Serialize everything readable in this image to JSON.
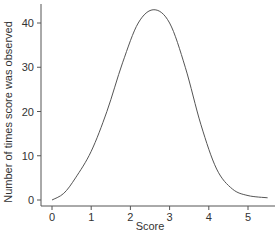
{
  "chart_data": {
    "type": "line",
    "title": "",
    "xlabel": "Score",
    "ylabel": "Number of times score was observed",
    "xlim": [
      -0.25,
      5.6
    ],
    "ylim": [
      -1,
      45
    ],
    "grid": false,
    "legend": null,
    "x_ticks": [
      0,
      1,
      2,
      3,
      4,
      5
    ],
    "y_ticks": [
      0,
      10,
      20,
      30,
      40
    ],
    "series": [
      {
        "name": "Observed frequency",
        "color": "#555555",
        "x": [
          0,
          0.3,
          0.6,
          1.0,
          1.4,
          1.8,
          2.2,
          2.6,
          3.0,
          3.4,
          3.8,
          4.2,
          4.6,
          5.0,
          5.5
        ],
        "values": [
          0,
          1.5,
          5,
          11,
          20,
          31,
          40,
          43,
          40,
          30,
          17,
          7,
          2.5,
          1,
          0.5
        ]
      }
    ]
  }
}
